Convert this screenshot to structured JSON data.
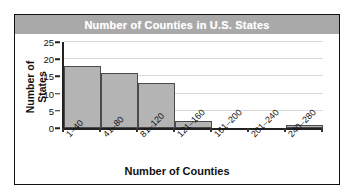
{
  "chart_data": {
    "type": "bar",
    "title": "Number of Counties in U.S. States",
    "xlabel": "Number of Counties",
    "ylabel_line1": "Number of",
    "ylabel_line2": "States",
    "categories": [
      "1–40",
      "41–80",
      "81–120",
      "121–160",
      "161–200",
      "201–240",
      "240–280"
    ],
    "values": [
      18,
      16,
      13,
      2,
      0,
      0,
      1
    ],
    "ylim": [
      0,
      25
    ],
    "yticks": [
      0,
      5,
      10,
      15,
      20,
      25
    ],
    "ytick_labels": [
      "0",
      "5",
      "10",
      "15",
      "20",
      "25"
    ],
    "grid": true,
    "legend": false,
    "colors": {
      "bar_fill": "#b4b4b4",
      "bar_border": "#4a4a4a",
      "title_band": "#a9a9a9",
      "title_text": "#ffffff",
      "axis": "#222222",
      "gridline": "#d8d8d8",
      "frame_border": "#111111",
      "plot_background": "#ffffff"
    }
  }
}
